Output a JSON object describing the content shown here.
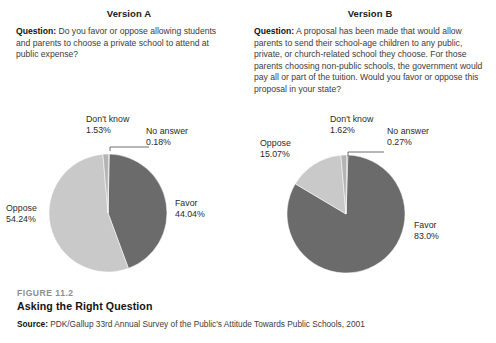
{
  "figure": {
    "number": "FIGURE 11.2",
    "title": "Asking the Right Question",
    "source_label": "Source:",
    "source_text": " PDK/Gallup 33rd Annual Survey of the Public's Attitude Towards Public Schools, 2001"
  },
  "panels": [
    {
      "version_title": "Version A",
      "question_label": "Question:",
      "question_text": " Do you favor or oppose allowing students and parents to choose a private school to attend at public expense?"
    },
    {
      "version_title": "Version B",
      "question_label": "Question:",
      "question_text": " A proposal has been made that would allow parents to send their school-age children to any public, private, or church-related school they choose. For those parents choosing non-public schools, the government would pay all or part of the tuition. Would you favor or oppose this proposal in your state?"
    }
  ],
  "colors": {
    "favor": "#6b6b6b",
    "oppose": "#c9c9c9",
    "dont_know": "#b4b4b4",
    "no_answer": "#8a8a8a",
    "leader_line": "#4a4a4a",
    "figure_number": "#8d8d8d"
  },
  "chart_data": [
    {
      "type": "pie",
      "title": "Version A",
      "categories": [
        "Favor",
        "Oppose",
        "Don't know",
        "No answer"
      ],
      "values": [
        44.04,
        54.24,
        1.53,
        0.18
      ],
      "labels": [
        "44.04%",
        "54.24%",
        "1.53%",
        "0.18%"
      ],
      "unit": "%",
      "legend": "labels-outside",
      "grid": false,
      "label_favor_name": "Favor",
      "label_favor_pct": "44.04%",
      "label_oppose_name": "Oppose",
      "label_oppose_pct": "54.24%",
      "label_dontknow_name": "Don't know",
      "label_dontknow_pct": "1.53%",
      "label_noanswer_name": "No answer",
      "label_noanswer_pct": "0.18%"
    },
    {
      "type": "pie",
      "title": "Version B",
      "categories": [
        "Favor",
        "Oppose",
        "Don't know",
        "No answer"
      ],
      "values": [
        83.0,
        15.07,
        1.62,
        0.27
      ],
      "labels": [
        "83.0%",
        "15.07%",
        "1.62%",
        "0.27%"
      ],
      "unit": "%",
      "legend": "labels-outside",
      "grid": false,
      "label_favor_name": "Favor",
      "label_favor_pct": "83.0%",
      "label_oppose_name": "Oppose",
      "label_oppose_pct": "15.07%",
      "label_dontknow_name": "Don't know",
      "label_dontknow_pct": "1.62%",
      "label_noanswer_name": "No answer",
      "label_noanswer_pct": "0.27%"
    }
  ]
}
